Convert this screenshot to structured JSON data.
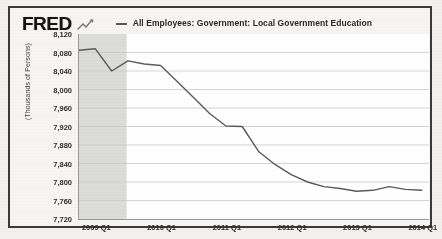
{
  "header": {
    "logo_text": "FRED",
    "logo_icon": "fred-squiggle-icon",
    "legend_marker": "line-dash-marker",
    "legend_label": "All Employees: Government: Local Government Education"
  },
  "chart_data": {
    "type": "line",
    "title": "",
    "series_name": "All Employees: Government: Local Government Education",
    "xlabel": "",
    "ylabel": "(Thousands of Persons)",
    "ylim": [
      7720,
      8120
    ],
    "ytick_step": 40,
    "yticks": [
      "8,120",
      "8,080",
      "8,040",
      "8,000",
      "7,960",
      "7,920",
      "7,880",
      "7,840",
      "7,800",
      "7,760",
      "7,720"
    ],
    "ytick_values": [
      8120,
      8080,
      8040,
      8000,
      7960,
      7920,
      7880,
      7840,
      7800,
      7760,
      7720
    ],
    "xticks": [
      "2009 Q1",
      "2010 Q1",
      "2011 Q1",
      "2012 Q1",
      "2013 Q1",
      "2014 Q1"
    ],
    "xtick_values": [
      2009.0,
      2010.0,
      2011.0,
      2012.0,
      2013.0,
      2014.0
    ],
    "xlim": [
      2008.72,
      2014.08
    ],
    "grid": true,
    "grid_axis": "y",
    "legend_position": "top",
    "line_color": "#5a5a60",
    "recession_shading": {
      "label": "recession-band",
      "color": "#dcdcda",
      "start": 2008.72,
      "end": 2009.45
    },
    "x": [
      2008.72,
      2008.97,
      2009.22,
      2009.47,
      2009.72,
      2009.97,
      2010.22,
      2010.47,
      2010.72,
      2010.97,
      2011.22,
      2011.47,
      2011.72,
      2011.97,
      2012.22,
      2012.47,
      2012.72,
      2012.97,
      2013.22,
      2013.47,
      2013.72,
      2013.97
    ],
    "values": [
      8085,
      8088,
      8040,
      8062,
      8055,
      8052,
      8018,
      7983,
      7948,
      7921,
      7920,
      7866,
      7838,
      7816,
      7800,
      7790,
      7786,
      7780,
      7782,
      7790,
      7784,
      7782
    ],
    "annotations": []
  }
}
